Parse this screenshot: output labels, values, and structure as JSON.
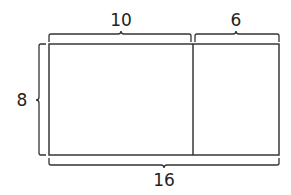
{
  "diagram": {
    "type": "area-model-rectangle",
    "colors": {
      "stroke": "#2a2a2a",
      "text": "#222222",
      "background": "#ffffff"
    },
    "dimensions": {
      "top_left_width": "10",
      "top_right_width": "6",
      "height": "8",
      "total_width": "16"
    },
    "regions": [
      {
        "name": "left-region",
        "width": 10,
        "height": 8
      },
      {
        "name": "right-region",
        "width": 6,
        "height": 8
      }
    ]
  }
}
